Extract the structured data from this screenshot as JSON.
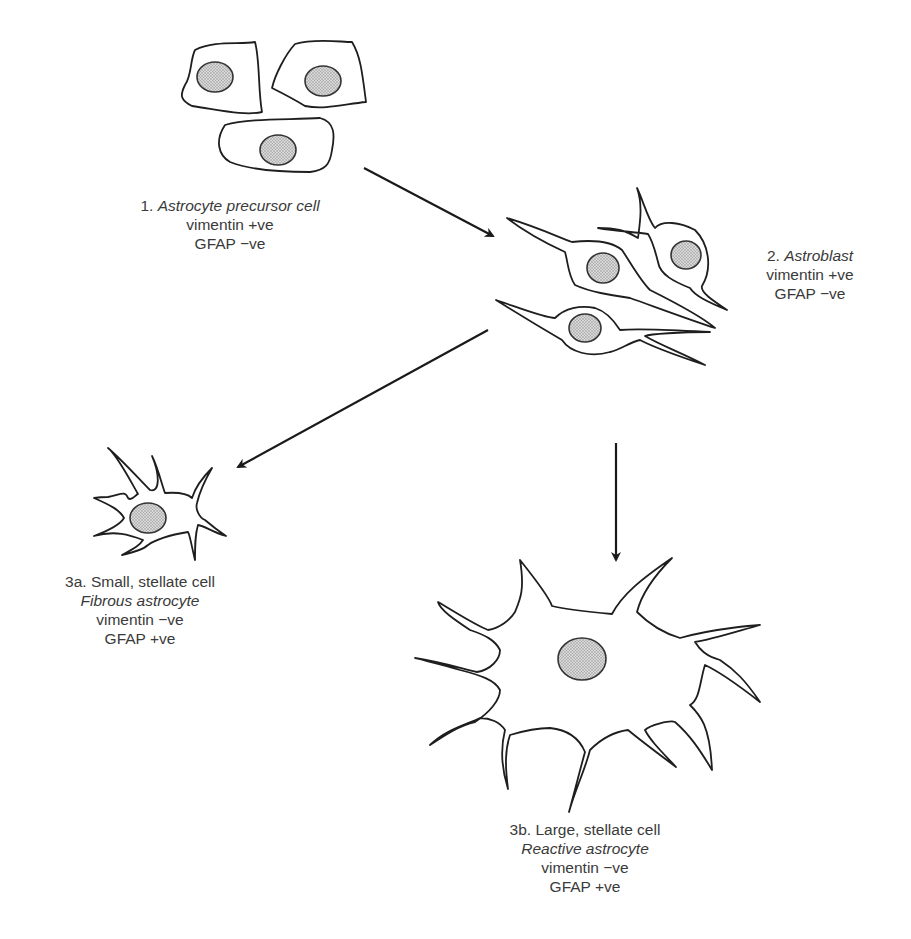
{
  "stages": [
    {
      "id": "1",
      "number": "1.",
      "name": "Astrocyte precursor cell",
      "vimentin": "vimentin +ve",
      "gfap": "GFAP −ve"
    },
    {
      "id": "2",
      "number": "2.",
      "name": "Astroblast",
      "vimentin": "vimentin +ve",
      "gfap": "GFAP −ve"
    },
    {
      "id": "3a",
      "description": "3a. Small, stellate cell",
      "name": "Fibrous astrocyte",
      "vimentin": "vimentin −ve",
      "gfap": "GFAP +ve"
    },
    {
      "id": "3b",
      "description": "3b. Large, stellate cell",
      "name": "Reactive astrocyte",
      "vimentin": "vimentin −ve",
      "gfap": "GFAP +ve"
    }
  ],
  "edges": [
    {
      "from": "1",
      "to": "2"
    },
    {
      "from": "2",
      "to": "3a"
    },
    {
      "from": "2",
      "to": "3b"
    }
  ],
  "colors": {
    "line": "#1e1e1e",
    "nucleus_fill": "#c8c8c8",
    "text": "#3a3a3a"
  }
}
